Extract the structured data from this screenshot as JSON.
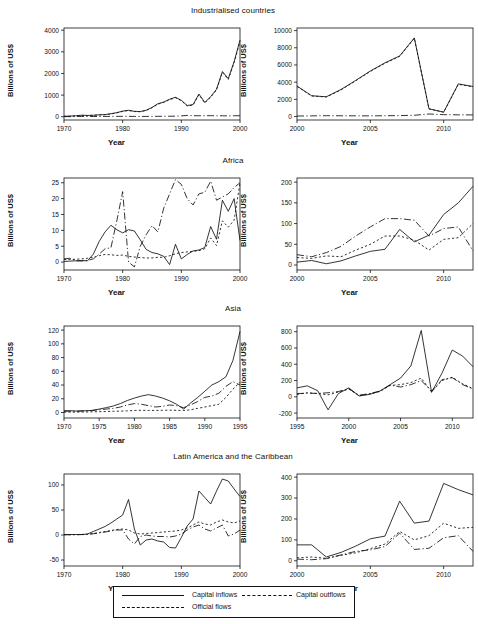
{
  "figure": {
    "axis_label_x": "Year",
    "axis_label_y": "Billions of US$"
  },
  "legend": {
    "items": [
      {
        "label": "Capital inflows",
        "style": "solid"
      },
      {
        "label": "Capital outflows",
        "style": "dashed"
      },
      {
        "label": "Official flows",
        "style": "dashdot"
      }
    ]
  },
  "chart_data": [
    {
      "type": "line",
      "title": "Industrialised countries",
      "panel": "industrialised-left",
      "xlabel": "Year",
      "ylabel": "Billions of US$",
      "xlim": [
        1970,
        2000
      ],
      "ylim": [
        -150,
        4100
      ],
      "xticks": [
        1970,
        1980,
        1990,
        2000
      ],
      "yticks": [
        0,
        1000,
        2000,
        3000,
        4000
      ],
      "grid": false,
      "x": [
        1970,
        1971,
        1972,
        1973,
        1974,
        1975,
        1976,
        1977,
        1978,
        1979,
        1980,
        1981,
        1982,
        1983,
        1984,
        1985,
        1986,
        1987,
        1988,
        1989,
        1990,
        1991,
        1992,
        1993,
        1994,
        1995,
        1996,
        1997,
        1998,
        1999,
        2000
      ],
      "series": [
        {
          "name": "Capital inflows",
          "style": "solid",
          "values": [
            20,
            30,
            45,
            70,
            60,
            70,
            90,
            100,
            140,
            190,
            260,
            300,
            250,
            240,
            300,
            430,
            600,
            680,
            810,
            900,
            760,
            520,
            560,
            1050,
            660,
            930,
            1270,
            2090,
            1760,
            2550,
            3540
          ]
        },
        {
          "name": "Capital outflows",
          "style": "dashed",
          "values": [
            20,
            28,
            40,
            65,
            55,
            65,
            85,
            95,
            130,
            180,
            245,
            290,
            240,
            230,
            290,
            415,
            580,
            660,
            790,
            880,
            740,
            500,
            540,
            1020,
            640,
            900,
            1240,
            2050,
            1720,
            2500,
            3480
          ]
        },
        {
          "name": "Official flows",
          "style": "dashdot",
          "values": [
            5,
            5,
            8,
            10,
            12,
            10,
            12,
            14,
            16,
            18,
            20,
            18,
            16,
            14,
            16,
            18,
            20,
            22,
            24,
            26,
            40,
            60,
            50,
            45,
            48,
            50,
            46,
            44,
            42,
            45,
            48
          ]
        }
      ]
    },
    {
      "type": "line",
      "title": "Industrialised countries",
      "panel": "industrialised-right",
      "xlabel": "Year",
      "ylabel": "Billions of US$",
      "xlim": [
        2000,
        2012
      ],
      "ylim": [
        -400,
        10300
      ],
      "xticks": [
        2000,
        2005,
        2010
      ],
      "yticks": [
        0,
        2000,
        4000,
        6000,
        8000,
        10000
      ],
      "grid": false,
      "x": [
        2000,
        2001,
        2002,
        2003,
        2004,
        2005,
        2006,
        2007,
        2008,
        2009,
        2010,
        2011,
        2012
      ],
      "series": [
        {
          "name": "Capital inflows",
          "style": "solid",
          "values": [
            3550,
            2420,
            2300,
            3150,
            4200,
            5300,
            6250,
            7050,
            9150,
            900,
            520,
            3800,
            3500
          ]
        },
        {
          "name": "Capital outflows",
          "style": "dashed",
          "values": [
            3500,
            2400,
            2280,
            3100,
            4150,
            5250,
            6200,
            7000,
            9100,
            880,
            500,
            3750,
            3450
          ]
        },
        {
          "name": "Official flows",
          "style": "dashdot",
          "values": [
            60,
            80,
            100,
            90,
            85,
            80,
            95,
            110,
            150,
            300,
            220,
            200,
            190
          ]
        }
      ]
    },
    {
      "type": "line",
      "title": "Africa",
      "panel": "africa-left",
      "xlabel": "Year",
      "ylabel": "Billions of US$",
      "xlim": [
        1970,
        2000
      ],
      "ylim": [
        -2.5,
        26.5
      ],
      "xticks": [
        1970,
        1980,
        1990,
        2000
      ],
      "yticks": [
        0,
        5,
        10,
        15,
        20,
        25
      ],
      "grid": false,
      "x": [
        1970,
        1971,
        1972,
        1973,
        1974,
        1975,
        1976,
        1977,
        1978,
        1979,
        1980,
        1981,
        1982,
        1983,
        1984,
        1985,
        1986,
        1987,
        1988,
        1989,
        1990,
        1991,
        1992,
        1993,
        1994,
        1995,
        1996,
        1997,
        1998,
        1999,
        2000
      ],
      "series": [
        {
          "name": "Capital inflows",
          "style": "solid",
          "values": [
            0.2,
            0.3,
            0.4,
            0.5,
            0.4,
            2.5,
            6.5,
            9.5,
            11.6,
            10.2,
            9.2,
            10.2,
            9.8,
            7.0,
            4.0,
            3.0,
            2.6,
            1.8,
            -0.8,
            5.6,
            1.0,
            2.4,
            3.5,
            3.8,
            4.6,
            11.2,
            7.2,
            19.5,
            16.0,
            20.0,
            6.8
          ]
        },
        {
          "name": "Capital outflows",
          "style": "dashed",
          "values": [
            0.8,
            0.8,
            0.9,
            1.0,
            1.2,
            1.5,
            2.0,
            2.4,
            2.3,
            2.1,
            2.2,
            1.8,
            1.6,
            1.4,
            1.3,
            1.3,
            1.5,
            1.5,
            2.0,
            2.6,
            3.0,
            3.2,
            3.4,
            3.6,
            4.2,
            7.6,
            5.2,
            13.0,
            11.0,
            13.2,
            25.0
          ]
        },
        {
          "name": "Official flows",
          "style": "dashdot",
          "values": [
            1.0,
            1.2,
            0.4,
            0.3,
            0.5,
            1.0,
            2.5,
            4.2,
            4.5,
            13.0,
            22.2,
            0.0,
            -1.5,
            5.0,
            8.6,
            11.5,
            9.5,
            17.0,
            21.5,
            26.0,
            24.5,
            20.0,
            18.0,
            21.5,
            22.0,
            25.5,
            19.5,
            20.5,
            21.5,
            23.5,
            25.0
          ]
        }
      ]
    },
    {
      "type": "line",
      "title": "Africa",
      "panel": "africa-right",
      "xlabel": "Year",
      "ylabel": "Billions of US$",
      "xlim": [
        2000,
        2012
      ],
      "ylim": [
        -12,
        210
      ],
      "xticks": [
        2000,
        2005,
        2010
      ],
      "yticks": [
        0,
        50,
        100,
        150,
        200
      ],
      "grid": false,
      "x": [
        2000,
        2001,
        2002,
        2003,
        2004,
        2005,
        2006,
        2007,
        2008,
        2009,
        2010,
        2011,
        2012
      ],
      "series": [
        {
          "name": "Capital inflows",
          "style": "solid",
          "values": [
            7,
            11,
            3,
            10,
            22,
            33,
            38,
            86,
            56,
            72,
            122,
            150,
            190
          ]
        },
        {
          "name": "Capital outflows",
          "style": "dashed",
          "values": [
            18,
            16,
            22,
            20,
            36,
            50,
            70,
            70,
            60,
            36,
            62,
            66,
            100
          ]
        },
        {
          "name": "Official flows",
          "style": "dashdot",
          "values": [
            25,
            20,
            30,
            45,
            70,
            92,
            112,
            112,
            108,
            70,
            88,
            92,
            34
          ]
        }
      ]
    },
    {
      "type": "line",
      "title": "Asia",
      "panel": "asia-left",
      "xlabel": "Year",
      "ylabel": "Billions of US$",
      "xlim": [
        1970,
        1995
      ],
      "ylim": [
        -8,
        126
      ],
      "xticks": [
        1970,
        1975,
        1980,
        1985,
        1990,
        1995
      ],
      "yticks": [
        0,
        20,
        40,
        60,
        80,
        100,
        120
      ],
      "grid": false,
      "x": [
        1970,
        1971,
        1972,
        1973,
        1974,
        1975,
        1976,
        1977,
        1978,
        1979,
        1980,
        1981,
        1982,
        1983,
        1984,
        1985,
        1986,
        1987,
        1988,
        1989,
        1990,
        1991,
        1992,
        1993,
        1994,
        1995
      ],
      "series": [
        {
          "name": "Capital inflows",
          "style": "solid",
          "values": [
            2.5,
            2.5,
            2.0,
            2.5,
            3.0,
            5.0,
            7.0,
            9.5,
            13.0,
            17.5,
            21.0,
            24.0,
            26.0,
            24.0,
            21.0,
            17.0,
            12.0,
            5.0,
            14.0,
            22.0,
            31.0,
            40.0,
            45.0,
            52.0,
            76.0,
            118.0
          ]
        },
        {
          "name": "Capital outflows",
          "style": "dashed",
          "values": [
            0.5,
            0.6,
            0.6,
            0.8,
            1.0,
            1.2,
            1.5,
            1.8,
            2.0,
            2.4,
            3.0,
            3.2,
            3.0,
            3.0,
            3.2,
            3.4,
            3.2,
            3.0,
            4.0,
            6.0,
            8.0,
            10.0,
            12.0,
            22.0,
            34.0,
            44.0
          ]
        },
        {
          "name": "Official flows",
          "style": "dashdot",
          "values": [
            2.0,
            2.0,
            2.2,
            2.5,
            3.0,
            4.0,
            5.0,
            6.0,
            8.0,
            11.0,
            13.0,
            12.0,
            10.0,
            8.0,
            9.0,
            11.0,
            10.0,
            7.0,
            11.0,
            16.0,
            22.0,
            24.0,
            28.0,
            38.0,
            45.0,
            40.0
          ]
        }
      ]
    },
    {
      "type": "line",
      "title": "Asia",
      "panel": "asia-right",
      "xlabel": "Year",
      "ylabel": "Billions of US$",
      "xlim": [
        1995,
        2012
      ],
      "ylim": [
        -260,
        870
      ],
      "xticks": [
        1995,
        2000,
        2005,
        2010
      ],
      "yticks": [
        -200,
        0,
        200,
        400,
        600,
        800
      ],
      "grid": false,
      "x": [
        1995,
        1996,
        1997,
        1998,
        1999,
        2000,
        2001,
        2002,
        2003,
        2004,
        2005,
        2006,
        2007,
        2008,
        2009,
        2010,
        2011,
        2012
      ],
      "series": [
        {
          "name": "Capital inflows",
          "style": "solid",
          "values": [
            110,
            135,
            75,
            -160,
            40,
            110,
            10,
            30,
            70,
            150,
            230,
            380,
            815,
            55,
            290,
            575,
            500,
            370
          ]
        },
        {
          "name": "Capital outflows",
          "style": "dashed",
          "values": [
            30,
            50,
            40,
            25,
            60,
            95,
            15,
            35,
            65,
            140,
            150,
            175,
            230,
            60,
            200,
            240,
            160,
            100
          ]
        },
        {
          "name": "Official flows",
          "style": "dashdot",
          "values": [
            40,
            45,
            42,
            50,
            65,
            100,
            20,
            40,
            70,
            145,
            120,
            150,
            200,
            70,
            210,
            235,
            150,
            95
          ]
        }
      ]
    },
    {
      "type": "line",
      "title": "Latin America and the Caribbean",
      "panel": "latam-left",
      "xlabel": "Year",
      "ylabel": "Billions of US$",
      "xlim": [
        1970,
        2000
      ],
      "ylim": [
        -62,
        122
      ],
      "xticks": [
        1970,
        1980,
        1990,
        2000
      ],
      "yticks": [
        -50,
        0,
        50,
        100
      ],
      "grid": false,
      "x": [
        1970,
        1971,
        1972,
        1973,
        1974,
        1975,
        1976,
        1977,
        1978,
        1979,
        1980,
        1981,
        1982,
        1983,
        1984,
        1985,
        1986,
        1987,
        1988,
        1989,
        1990,
        1991,
        1992,
        1993,
        1994,
        1995,
        1996,
        1997,
        1998,
        1999,
        2000
      ],
      "series": [
        {
          "name": "Capital inflows",
          "style": "solid",
          "values": [
            1,
            1,
            1,
            1,
            2,
            7,
            12,
            17,
            24,
            32,
            40,
            71,
            12,
            -20,
            -10,
            -8,
            -12,
            -14,
            -25,
            -26,
            -5,
            18,
            32,
            88,
            75,
            62,
            88,
            112,
            108,
            92,
            77
          ]
        },
        {
          "name": "Capital outflows",
          "style": "dashed",
          "values": [
            0.5,
            0.6,
            0.8,
            1.0,
            1.5,
            3,
            5,
            7,
            9,
            11,
            12,
            10,
            4,
            2,
            3,
            4,
            5,
            6,
            7,
            8,
            10,
            14,
            20,
            26,
            22,
            20,
            26,
            30,
            26,
            24,
            28
          ]
        },
        {
          "name": "Official flows",
          "style": "dashdot",
          "values": [
            0.5,
            0.5,
            0.6,
            0.8,
            1.2,
            2.5,
            4,
            6,
            8,
            10,
            10,
            -8,
            -18,
            -3,
            0,
            -2,
            -3,
            -3,
            -4,
            -2,
            2,
            10,
            16,
            20,
            12,
            8,
            14,
            20,
            -2,
            2,
            10
          ]
        }
      ]
    },
    {
      "type": "line",
      "title": "Latin America and the Caribbean",
      "panel": "latam-right",
      "xlabel": "Year",
      "ylabel": "Billions of US$",
      "xlim": [
        2000,
        2012
      ],
      "ylim": [
        -25,
        415
      ],
      "xticks": [
        2000,
        2005,
        2010
      ],
      "yticks": [
        0,
        100,
        200,
        300,
        400
      ],
      "grid": false,
      "x": [
        2000,
        2001,
        2002,
        2003,
        2004,
        2005,
        2006,
        2007,
        2008,
        2009,
        2010,
        2011,
        2012
      ],
      "series": [
        {
          "name": "Capital inflows",
          "style": "solid",
          "values": [
            76,
            76,
            18,
            40,
            70,
            105,
            118,
            285,
            180,
            190,
            370,
            340,
            315
          ]
        },
        {
          "name": "Capital outflows",
          "style": "dashed",
          "values": [
            14,
            18,
            12,
            26,
            38,
            58,
            80,
            140,
            100,
            120,
            180,
            155,
            160
          ]
        },
        {
          "name": "Official flows",
          "style": "dashdot",
          "values": [
            8,
            5,
            10,
            28,
            45,
            52,
            68,
            132,
            54,
            60,
            110,
            120,
            45
          ]
        }
      ]
    }
  ]
}
